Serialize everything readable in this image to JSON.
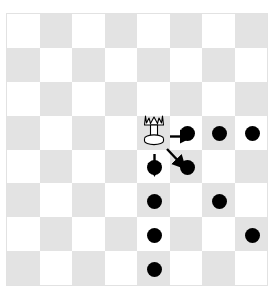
{
  "figure": {
    "background_color": "#ffffff"
  },
  "board": {
    "name": "chessboard",
    "rows": 8,
    "columns": 8,
    "light_square_color": "#ffffff",
    "dark_square_color": "#e3e3e3",
    "border_color": "#e2e2e2",
    "origin_square_color_at_a8": "light"
  },
  "piece": {
    "name": "white-queen",
    "type": "queen",
    "color": "white",
    "column": 4,
    "row": 3,
    "fill": "#ffffff",
    "outline": "#000000"
  },
  "chart_data": {
    "type": "scatter",
    "xlabel": "file (column index)",
    "ylabel": "rank (row index)",
    "xlim": [
      0,
      8
    ],
    "ylim": [
      0,
      8
    ],
    "grid": true,
    "legend": "none",
    "series": [
      {
        "name": "queen",
        "marker": "queen-piece",
        "color": "#ffffff",
        "points": [
          {
            "x": 4,
            "y": 3
          }
        ]
      },
      {
        "name": "legal-move-dots",
        "marker": "filled-circle",
        "color": "#000000",
        "points": [
          {
            "x": 5,
            "y": 3
          },
          {
            "x": 6,
            "y": 3
          },
          {
            "x": 7,
            "y": 3
          },
          {
            "x": 4,
            "y": 4
          },
          {
            "x": 4,
            "y": 5
          },
          {
            "x": 4,
            "y": 6
          },
          {
            "x": 4,
            "y": 7
          },
          {
            "x": 5,
            "y": 4
          },
          {
            "x": 6,
            "y": 5
          },
          {
            "x": 7,
            "y": 6
          }
        ]
      }
    ],
    "annotations": [
      {
        "type": "arrow",
        "label": "move-right",
        "from": {
          "x": 4,
          "y": 3
        },
        "to": {
          "x": 5,
          "y": 3
        }
      },
      {
        "type": "arrow",
        "label": "move-down",
        "from": {
          "x": 4,
          "y": 3
        },
        "to": {
          "x": 4,
          "y": 4
        }
      },
      {
        "type": "arrow",
        "label": "move-diagonal-down-right",
        "from": {
          "x": 4,
          "y": 3
        },
        "to": {
          "x": 5,
          "y": 4
        }
      }
    ]
  },
  "dots": [
    {
      "name": "move-dot-f5",
      "column": 5,
      "row": 3
    },
    {
      "name": "move-dot-g5",
      "column": 6,
      "row": 3
    },
    {
      "name": "move-dot-h5",
      "column": 7,
      "row": 3
    },
    {
      "name": "move-dot-e4",
      "column": 4,
      "row": 4
    },
    {
      "name": "move-dot-e3",
      "column": 4,
      "row": 5
    },
    {
      "name": "move-dot-e2",
      "column": 4,
      "row": 6
    },
    {
      "name": "move-dot-e1",
      "column": 4,
      "row": 7
    },
    {
      "name": "move-dot-f4",
      "column": 5,
      "row": 4
    },
    {
      "name": "move-dot-g3",
      "column": 6,
      "row": 5
    },
    {
      "name": "move-dot-h2",
      "column": 7,
      "row": 6
    }
  ],
  "arrows": [
    {
      "name": "arrow-right",
      "from_column": 4,
      "from_row": 3,
      "to_column": 5,
      "to_row": 3
    },
    {
      "name": "arrow-down",
      "from_column": 4,
      "from_row": 3,
      "to_column": 4,
      "to_row": 4
    },
    {
      "name": "arrow-diagonal",
      "from_column": 4,
      "from_row": 3,
      "to_column": 5,
      "to_row": 4
    }
  ]
}
